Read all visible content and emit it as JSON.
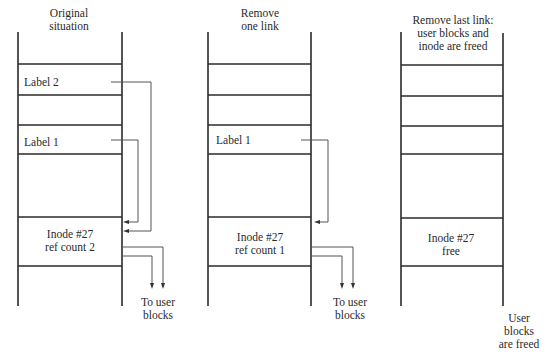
{
  "diagram": {
    "colors": {
      "line": "#2a2a2a",
      "link": "#555555",
      "background": "#ffffff"
    },
    "panels": [
      {
        "heading_line1": "Original",
        "heading_line2": "situation",
        "label_2": "Label 2",
        "label_1": "Label 1",
        "inode_line1": "Inode #27",
        "inode_line2": "ref count 2",
        "footer_line1": "To user",
        "footer_line2": "blocks"
      },
      {
        "heading_line1": "Remove",
        "heading_line2": "one link",
        "label_1": "Label 1",
        "inode_line1": "Inode #27",
        "inode_line2": "ref count 1",
        "footer_line1": "To user",
        "footer_line2": "blocks"
      },
      {
        "heading_line1": "Remove last link:",
        "heading_line2": "user blocks and",
        "heading_line3": "inode are freed",
        "inode_line1": "Inode #27",
        "inode_line2": "free",
        "footer_line1": "User",
        "footer_line2": "blocks",
        "footer_line3": "are freed"
      }
    ]
  }
}
